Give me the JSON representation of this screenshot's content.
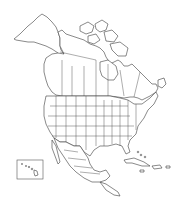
{
  "map": {
    "title": "",
    "region": "North America",
    "style": "outline",
    "colors": {
      "background": "#ffffff",
      "stroke": "#3a3a3a"
    },
    "insets": [
      {
        "name": "hawaii-inset"
      }
    ],
    "labels": []
  }
}
